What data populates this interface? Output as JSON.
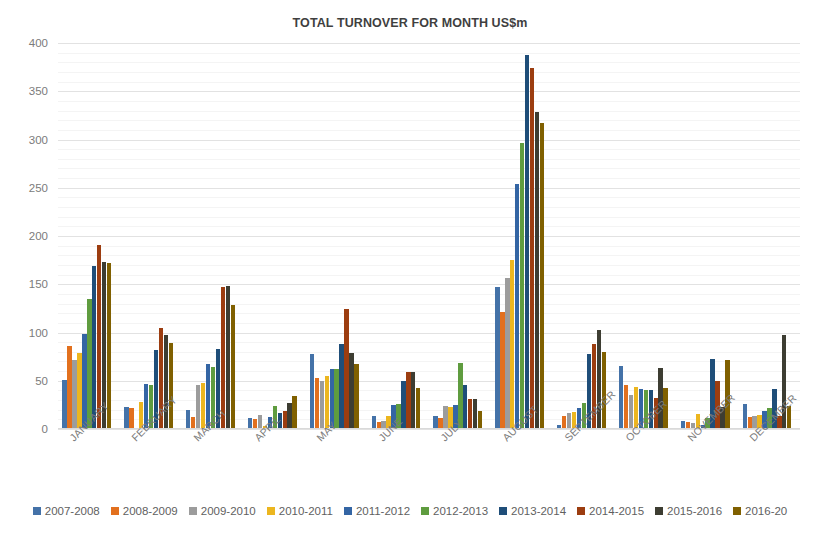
{
  "chart_data": {
    "type": "bar",
    "title": "TOTAL TURNOVER FOR MONTH US$m",
    "xlabel": "",
    "ylabel": "",
    "ylim": [
      0,
      400
    ],
    "ytick_step": 50,
    "ytick_labels": [
      "400",
      "350",
      "300",
      "250",
      "200",
      "150",
      "100",
      "50",
      "0"
    ],
    "grid": true,
    "legend_position": "bottom",
    "categories": [
      "JANUARY",
      "FEBRUARY",
      "MARCH",
      "APRIL",
      "MAY",
      "JUNE",
      "JULY",
      "AUGUST",
      "SEPTEMBER",
      "OCTOBER",
      "NOVEMBER",
      "DECEMBER"
    ],
    "series": [
      {
        "name": "2007-2008",
        "color": "#4472a8",
        "values": [
          51,
          23,
          20,
          11,
          78,
          14,
          14,
          147,
          4,
          65,
          8,
          26
        ]
      },
      {
        "name": "2008-2009",
        "color": "#e2701e",
        "values": [
          86,
          22,
          12,
          10,
          53,
          7,
          11,
          121,
          14,
          46,
          7,
          12
        ]
      },
      {
        "name": "2009-2010",
        "color": "#9c9c9c",
        "values": [
          72,
          1,
          46,
          15,
          50,
          8,
          24,
          157,
          17,
          35,
          6,
          13
        ]
      },
      {
        "name": "2010-2011",
        "color": "#ecb61f",
        "values": [
          79,
          28,
          48,
          3,
          55,
          13,
          23,
          175,
          18,
          44,
          16,
          15
        ]
      },
      {
        "name": "2011-2012",
        "color": "#3465a4",
        "values": [
          98,
          47,
          67,
          12,
          62,
          25,
          25,
          254,
          22,
          41,
          4,
          19
        ]
      },
      {
        "name": "2012-2013",
        "color": "#5f9c3f",
        "values": [
          135,
          46,
          64,
          24,
          62,
          26,
          68,
          296,
          27,
          40,
          11,
          22
        ]
      },
      {
        "name": "2013-2014",
        "color": "#1f4e79",
        "values": [
          169,
          82,
          83,
          17,
          88,
          50,
          46,
          388,
          78,
          40,
          73,
          41
        ]
      },
      {
        "name": "2014-2015",
        "color": "#9c3d10",
        "values": [
          191,
          105,
          147,
          19,
          124,
          59,
          31,
          374,
          88,
          32,
          50,
          13
        ]
      },
      {
        "name": "2015-2016",
        "color": "#3d3d32",
        "values": [
          173,
          97,
          148,
          27,
          79,
          59,
          31,
          328,
          103,
          63,
          23,
          97
        ]
      },
      {
        "name": "2016-20",
        "color": "#806000",
        "values": [
          172,
          89,
          129,
          34,
          67,
          43,
          19,
          317,
          80,
          42,
          72,
          24
        ]
      }
    ]
  }
}
